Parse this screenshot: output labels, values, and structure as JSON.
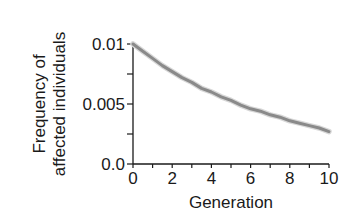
{
  "chart_data": {
    "type": "line",
    "title": "",
    "xlabel": "Generation",
    "ylabel": [
      "Frequency of",
      "affected individuals"
    ],
    "xlim": [
      0,
      10
    ],
    "ylim": [
      0,
      0.01
    ],
    "x_ticks": [
      {
        "value": 0,
        "label": "0"
      },
      {
        "value": 1,
        "label": ""
      },
      {
        "value": 2,
        "label": "2"
      },
      {
        "value": 3,
        "label": ""
      },
      {
        "value": 4,
        "label": "4"
      },
      {
        "value": 5,
        "label": ""
      },
      {
        "value": 6,
        "label": "6"
      },
      {
        "value": 7,
        "label": ""
      },
      {
        "value": 8,
        "label": "8"
      },
      {
        "value": 9,
        "label": ""
      },
      {
        "value": 10,
        "label": "10"
      }
    ],
    "y_ticks": [
      {
        "value": 0,
        "label": "0.0"
      },
      {
        "value": 0.0025,
        "label": ""
      },
      {
        "value": 0.005,
        "label": "0.005"
      },
      {
        "value": 0.0075,
        "label": ""
      },
      {
        "value": 0.01,
        "label": "0.01"
      }
    ],
    "grid": false,
    "legend": null,
    "series": [
      {
        "name": "frequency",
        "color": "#8a8a8a",
        "x": [
          0,
          0.5,
          1,
          1.5,
          2,
          2.5,
          3,
          3.5,
          4,
          4.5,
          5,
          5.5,
          6,
          6.5,
          7,
          7.5,
          8,
          8.5,
          9,
          9.5,
          10
        ],
        "values": [
          0.01,
          0.0094,
          0.0088,
          0.0082,
          0.0077,
          0.0072,
          0.0068,
          0.0063,
          0.006,
          0.0056,
          0.0053,
          0.0049,
          0.0046,
          0.0044,
          0.0041,
          0.0039,
          0.0036,
          0.0034,
          0.0032,
          0.003,
          0.0027
        ]
      }
    ]
  }
}
